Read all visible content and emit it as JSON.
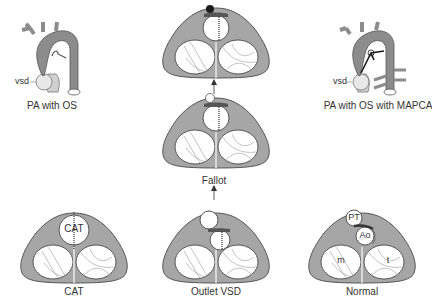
{
  "colors": {
    "tissue": "#a6a6a6",
    "aorta": "#8c8c8c",
    "outline": "#555555",
    "lumen": "#ffffff",
    "pa_trunk": "#cfcfcf",
    "dark": "#1a1a1a",
    "text": "#333333"
  },
  "panels": {
    "pa_with_os": {
      "caption": "PA with OS",
      "vsd_label": "vsd"
    },
    "pa_with_os_mapca": {
      "caption": "PA with OS with MAPCA",
      "vsd_label": "vsd"
    },
    "fallot_top": {
      "caption": ""
    },
    "fallot": {
      "caption": "Fallot"
    },
    "cat": {
      "caption": "CAT",
      "inner_label": "CAT"
    },
    "outlet_vsd": {
      "caption": "Outlet VSD"
    },
    "normal": {
      "caption": "Normal",
      "labels": {
        "pt": "PT",
        "ao": "Ao",
        "m": "m",
        "t": "t"
      }
    }
  },
  "arrows": [
    {
      "from": "outlet_vsd",
      "to": "fallot",
      "direction": "up"
    },
    {
      "from": "fallot",
      "to": "fallot_top",
      "direction": "up"
    }
  ]
}
